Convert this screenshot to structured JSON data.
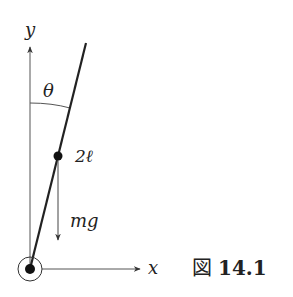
{
  "diagram": {
    "axes": {
      "x_label": "x",
      "y_label": "y"
    },
    "angle_label": "θ",
    "length_label": "2ℓ",
    "force_label": "mg",
    "caption": {
      "prefix": "図",
      "number": "14.1"
    },
    "colors": {
      "ink": "#222222",
      "background": "#ffffff"
    }
  }
}
